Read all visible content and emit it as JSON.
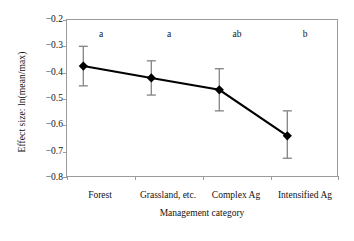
{
  "chart_data": {
    "type": "line",
    "title": "",
    "subtitle": "",
    "xlabel": "Management category",
    "ylabel": "Effect size: ln(mean/max)",
    "categories": [
      "Forest",
      "Grassland, etc.",
      "Complex Ag",
      "Intensified Ag"
    ],
    "values": [
      -0.375,
      -0.42,
      -0.465,
      -0.64
    ],
    "error_upper": [
      -0.3,
      -0.355,
      -0.385,
      -0.545
    ],
    "error_lower": [
      -0.45,
      -0.485,
      -0.545,
      -0.725
    ],
    "annotations": [
      "a",
      "a",
      "ab",
      "b"
    ],
    "ylim": [
      -0.8,
      -0.2
    ],
    "yticks": [
      -0.2,
      -0.3,
      -0.4,
      -0.5,
      -0.6,
      -0.7,
      -0.8
    ],
    "ytick_labels": [
      "−0.2",
      "−0.3",
      "−0.4",
      "−0.5",
      "−0.6",
      "−0.7",
      "−0.8"
    ],
    "grid": false,
    "legend": "none",
    "marker": "diamond",
    "series_color": "#000000",
    "errorbar_color": "#8a8a8a",
    "axis_color": "#9b9b9b"
  }
}
